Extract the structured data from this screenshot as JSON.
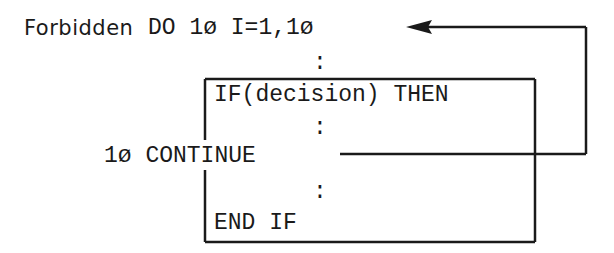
{
  "diagram": {
    "label": "Forbidden",
    "lines": {
      "do": "DO 1ø I=1,1ø",
      "dots1": ":",
      "if": "IF(decision) THEN",
      "dots2": ":",
      "continue": "1ø CONTINUE",
      "dots3": ":",
      "endif": "END IF"
    },
    "connectors": [
      {
        "from": "continue",
        "to": "do",
        "type": "arrow-back"
      }
    ],
    "block": {
      "kind": "if-block",
      "contains": [
        "if",
        "dots2",
        "continue",
        "dots3",
        "endif"
      ]
    }
  }
}
